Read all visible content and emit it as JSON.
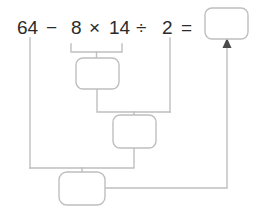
{
  "worksheet": {
    "type": "order-of-operations-breakdown",
    "expression": "64 − 8 × 14 ÷ 2 =",
    "stroke_color": "#bfbfbf",
    "text_color": "#2b2b2b",
    "background_color": "#ffffff",
    "tokens": [
      {
        "id": "operand-64",
        "text": "64"
      },
      {
        "id": "operator-minus",
        "text": "−"
      },
      {
        "id": "operand-8",
        "text": "8"
      },
      {
        "id": "operator-times",
        "text": "×"
      },
      {
        "id": "operand-14",
        "text": "14"
      },
      {
        "id": "operator-divide",
        "text": "÷"
      },
      {
        "id": "operand-2",
        "text": "2"
      },
      {
        "id": "operator-equals",
        "text": "="
      }
    ],
    "answer_boxes": [
      {
        "id": "final-answer-box",
        "value": "",
        "step": 4
      },
      {
        "id": "step-1-box",
        "value": "",
        "step": 1
      },
      {
        "id": "step-2-box",
        "value": "",
        "step": 2
      },
      {
        "id": "step-3-box",
        "value": "",
        "step": 3
      }
    ]
  }
}
